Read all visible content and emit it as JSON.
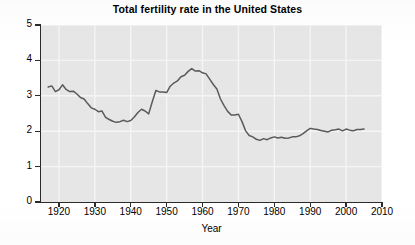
{
  "chart_data": {
    "type": "line",
    "title": "Total fertility rate in the United States",
    "xlabel": "Year",
    "ylabel": "",
    "xlim": [
      1915,
      2010
    ],
    "ylim": [
      0,
      5
    ],
    "xticks": [
      1920,
      1930,
      1940,
      1950,
      1960,
      1970,
      1980,
      1990,
      2000,
      2010
    ],
    "yticks": [
      0,
      1,
      2,
      3,
      4,
      5
    ],
    "grid": true,
    "legend": null,
    "line_color": "#5a5a5a",
    "plot_background": "#e6e6e6",
    "gridline_color": "#f5f5f5",
    "series": [
      {
        "name": "Total fertility rate",
        "x": [
          1917,
          1918,
          1919,
          1920,
          1921,
          1922,
          1923,
          1924,
          1925,
          1926,
          1927,
          1928,
          1929,
          1930,
          1931,
          1932,
          1933,
          1934,
          1935,
          1936,
          1937,
          1938,
          1939,
          1940,
          1941,
          1942,
          1943,
          1944,
          1945,
          1946,
          1947,
          1948,
          1949,
          1950,
          1951,
          1952,
          1953,
          1954,
          1955,
          1956,
          1957,
          1958,
          1959,
          1960,
          1961,
          1962,
          1963,
          1964,
          1965,
          1966,
          1967,
          1968,
          1969,
          1970,
          1971,
          1972,
          1973,
          1974,
          1975,
          1976,
          1977,
          1978,
          1979,
          1980,
          1981,
          1982,
          1983,
          1984,
          1985,
          1986,
          1987,
          1988,
          1989,
          1990,
          1991,
          1992,
          1993,
          1994,
          1995,
          1996,
          1997,
          1998,
          1999,
          2000,
          2001,
          2002,
          2003,
          2004,
          2005
        ],
        "y": [
          3.25,
          3.28,
          3.12,
          3.17,
          3.31,
          3.18,
          3.12,
          3.13,
          3.05,
          2.95,
          2.91,
          2.78,
          2.66,
          2.62,
          2.55,
          2.57,
          2.39,
          2.33,
          2.28,
          2.25,
          2.27,
          2.31,
          2.27,
          2.3,
          2.4,
          2.53,
          2.62,
          2.57,
          2.49,
          2.83,
          3.15,
          3.11,
          3.11,
          3.09,
          3.27,
          3.36,
          3.42,
          3.54,
          3.58,
          3.69,
          3.77,
          3.7,
          3.71,
          3.65,
          3.62,
          3.47,
          3.32,
          3.19,
          2.91,
          2.72,
          2.56,
          2.46,
          2.46,
          2.48,
          2.27,
          2.01,
          1.88,
          1.84,
          1.77,
          1.74,
          1.79,
          1.76,
          1.81,
          1.84,
          1.81,
          1.83,
          1.8,
          1.81,
          1.84,
          1.84,
          1.87,
          1.93,
          2.01,
          2.08,
          2.06,
          2.05,
          2.02,
          2.0,
          1.98,
          2.03,
          2.04,
          2.06,
          2.01,
          2.06,
          2.03,
          2.01,
          2.05,
          2.05,
          2.06
        ]
      }
    ],
    "annotations": []
  },
  "axes": {
    "y_tick_labels": [
      "5",
      "4",
      "3",
      "2",
      "1",
      "0"
    ],
    "x_tick_labels": [
      "1920",
      "1930",
      "1940",
      "1950",
      "1960",
      "1970",
      "1980",
      "1990",
      "2000",
      "2010"
    ],
    "x_axis_title": "Year"
  }
}
